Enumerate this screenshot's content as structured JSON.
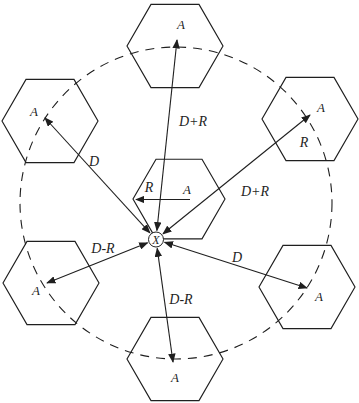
{
  "canvas": {
    "width": 359,
    "height": 403,
    "background": "#ffffff",
    "ink": "#1f1f1f"
  },
  "reuse_ring": {
    "cx": 176,
    "cy": 203,
    "r": 156,
    "dash": "9 7"
  },
  "mobile_station": {
    "x": 156,
    "y": 239.5,
    "r": 7.5,
    "label": "X"
  },
  "cells": [
    {
      "id": "center",
      "cx": 179,
      "cy": 199,
      "r": 46,
      "label": "A",
      "label_x": 187,
      "label_y": 194
    },
    {
      "id": "top",
      "cx": 175,
      "cy": 46,
      "r": 48,
      "label": "A",
      "label_x": 181,
      "label_y": 29
    },
    {
      "id": "upper-left",
      "cx": 50,
      "cy": 121,
      "r": 48,
      "label": "A",
      "label_x": 34,
      "label_y": 116
    },
    {
      "id": "upper-right",
      "cx": 310,
      "cy": 119,
      "r": 48,
      "label": "A",
      "label_x": 321,
      "label_y": 112
    },
    {
      "id": "lower-left",
      "cx": 51,
      "cy": 283,
      "r": 48,
      "label": "A",
      "label_x": 36,
      "label_y": 295
    },
    {
      "id": "lower-right",
      "cx": 307,
      "cy": 287,
      "r": 48,
      "label": "A",
      "label_x": 319,
      "label_y": 301
    },
    {
      "id": "bottom",
      "cx": 175,
      "cy": 359,
      "r": 48,
      "label": "A",
      "label_x": 175,
      "label_y": 382
    }
  ],
  "distance_arrows": [
    {
      "to": "top",
      "x2": 177,
      "y2": 40,
      "label": "D+R",
      "label_x": 193,
      "label_y": 126
    },
    {
      "to": "upper-left",
      "x2": 45,
      "y2": 118,
      "label": "D",
      "label_x": 94,
      "label_y": 166
    },
    {
      "to": "upper-right",
      "x2": 310,
      "y2": 115,
      "label": "D+R",
      "label_x": 255,
      "label_y": 196
    },
    {
      "to": "lower-left",
      "x2": 47,
      "y2": 283,
      "label": "D-R",
      "label_x": 103,
      "label_y": 253
    },
    {
      "to": "lower-right",
      "x2": 307,
      "y2": 288,
      "label": "D",
      "label_x": 237,
      "label_y": 262
    },
    {
      "to": "bottom",
      "x2": 173,
      "y2": 362,
      "label": "D-R",
      "label_x": 181,
      "label_y": 304
    }
  ],
  "cell_radius_arrow": {
    "x1": 190,
    "y1": 199.5,
    "x2": 136,
    "y2": 199.5,
    "label": "R",
    "label_x": 149,
    "label_y": 192
  },
  "remote_radius_label": {
    "label": "R",
    "x": 304,
    "y": 147
  },
  "styles": {
    "line_width": 1.1,
    "hex_width": 1.15,
    "ring_width": 1.1,
    "distance_font_px": 14,
    "cell_font_px": 13,
    "mobile_font_px": 12
  }
}
